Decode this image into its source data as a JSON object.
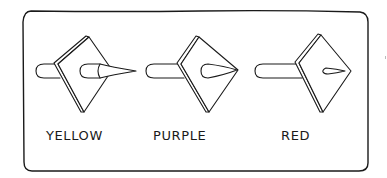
{
  "figure": {
    "items": [
      {
        "label": "YELLOW",
        "variant": "long-cone-protruding"
      },
      {
        "label": "PURPLE",
        "variant": "short-cone-at-edge"
      },
      {
        "label": "RED",
        "variant": "small-inner-wedge"
      }
    ]
  },
  "colors": {
    "ink": "#1a1a1a",
    "paper": "#ffffff"
  }
}
